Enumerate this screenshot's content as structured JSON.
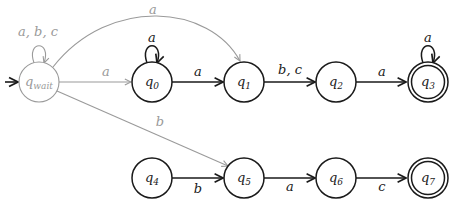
{
  "diagram": {
    "type": "finite-automaton",
    "colors": {
      "main": "#1a1a1a",
      "faded": "#9a9a9a"
    },
    "states": [
      {
        "id": "qwait",
        "label": "q",
        "sub": "wait",
        "x": 39,
        "y": 82,
        "initial": true,
        "accepting": false,
        "faded": true
      },
      {
        "id": "q0",
        "label": "q",
        "sub": "0",
        "x": 152,
        "y": 82,
        "accepting": false
      },
      {
        "id": "q1",
        "label": "q",
        "sub": "1",
        "x": 244,
        "y": 82,
        "accepting": false
      },
      {
        "id": "q2",
        "label": "q",
        "sub": "2",
        "x": 336,
        "y": 82,
        "accepting": false
      },
      {
        "id": "q3",
        "label": "q",
        "sub": "3",
        "x": 428,
        "y": 82,
        "accepting": true
      },
      {
        "id": "q4",
        "label": "q",
        "sub": "4",
        "x": 152,
        "y": 178,
        "accepting": false
      },
      {
        "id": "q5",
        "label": "q",
        "sub": "5",
        "x": 244,
        "y": 178,
        "accepting": false
      },
      {
        "id": "q6",
        "label": "q",
        "sub": "6",
        "x": 336,
        "y": 178,
        "accepting": false
      },
      {
        "id": "q7",
        "label": "q",
        "sub": "7",
        "x": 428,
        "y": 178,
        "accepting": true
      }
    ],
    "transitions": [
      {
        "from": "qwait",
        "to": "qwait",
        "label": "a, b, c",
        "faded": true
      },
      {
        "from": "qwait",
        "to": "q0",
        "label": "a",
        "faded": true
      },
      {
        "from": "qwait",
        "to": "q1",
        "label": "a",
        "faded": true
      },
      {
        "from": "qwait",
        "to": "q5",
        "label": "b",
        "faded": true
      },
      {
        "from": "q0",
        "to": "q0",
        "label": "a"
      },
      {
        "from": "q0",
        "to": "q1",
        "label": "a"
      },
      {
        "from": "q1",
        "to": "q2",
        "label": "b, c"
      },
      {
        "from": "q2",
        "to": "q3",
        "label": "a"
      },
      {
        "from": "q3",
        "to": "q3",
        "label": "a"
      },
      {
        "from": "q4",
        "to": "q5",
        "label": "b"
      },
      {
        "from": "q5",
        "to": "q6",
        "label": "a"
      },
      {
        "from": "q6",
        "to": "q7",
        "label": "c"
      }
    ]
  }
}
